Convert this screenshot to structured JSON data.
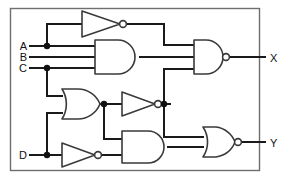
{
  "figure": {
    "background_color": "#ffffff",
    "wire_color": "#1a1a1a",
    "gate_outline_color": "#3a3a3a",
    "frame_color": "#6e6e6e"
  },
  "inputs": [
    {
      "id": "A",
      "label": "A",
      "x": 22,
      "y": 46
    },
    {
      "id": "B",
      "label": "B",
      "x": 22,
      "y": 57
    },
    {
      "id": "C",
      "label": "C",
      "x": 22,
      "y": 68
    },
    {
      "id": "D",
      "label": "D",
      "x": 22,
      "y": 155
    }
  ],
  "outputs": [
    {
      "id": "X",
      "label": "X",
      "x": 272,
      "y": 58
    },
    {
      "id": "Y",
      "label": "Y",
      "x": 272,
      "y": 146
    }
  ],
  "gates": [
    {
      "id": "inv-top",
      "type": "NOT",
      "label": "NOT",
      "inputs": 1,
      "has_bubble": true
    },
    {
      "id": "and-top",
      "type": "AND",
      "label": "AND",
      "inputs": 3,
      "has_bubble": false
    },
    {
      "id": "nand-out",
      "type": "NAND",
      "label": "NAND",
      "inputs": 3,
      "has_bubble": true
    },
    {
      "id": "or-mid",
      "type": "OR",
      "label": "OR",
      "inputs": 2,
      "has_bubble": false
    },
    {
      "id": "inv-mid",
      "type": "NOT",
      "label": "NOT",
      "inputs": 1,
      "has_bubble": true
    },
    {
      "id": "inv-bottom",
      "type": "NOT",
      "label": "NOT",
      "inputs": 1,
      "has_bubble": true
    },
    {
      "id": "and-bottom",
      "type": "AND",
      "label": "AND",
      "inputs": 2,
      "has_bubble": false
    },
    {
      "id": "nor-out",
      "type": "NOR",
      "label": "NOR",
      "inputs": 2,
      "has_bubble": true
    }
  ],
  "junctions": [
    {
      "id": "j-a",
      "on": "A",
      "x": 47,
      "y": 46
    },
    {
      "id": "j-c",
      "on": "C",
      "x": 47,
      "y": 68
    },
    {
      "id": "j-or-out",
      "on": "or-mid-output",
      "x": 104,
      "y": 104
    },
    {
      "id": "j-inv-mid-out",
      "on": "inv-mid-output",
      "x": 164,
      "y": 104
    },
    {
      "id": "j-d",
      "on": "D",
      "x": 47,
      "y": 155
    }
  ]
}
